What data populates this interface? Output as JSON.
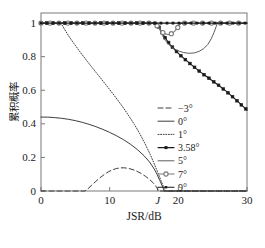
{
  "chart_data": {
    "type": "line",
    "title": "",
    "xlabel": "JSR/dB",
    "ylabel": "累积概率",
    "xlim": [
      0,
      30
    ],
    "ylim": [
      0,
      1.06
    ],
    "grid": false,
    "legend_position": "right-middle",
    "x_tick_labels": [
      "0",
      "10",
      "J",
      "20",
      "30"
    ],
    "x_tick_values": [
      0,
      10,
      17,
      20,
      30
    ],
    "x_tick_italic_index": 2,
    "y_tick_labels": [
      "0",
      "0.2",
      "0.4",
      "0.6",
      "0.8",
      "1"
    ],
    "y_tick_values": [
      0,
      0.2,
      0.4,
      0.6,
      0.8,
      1
    ],
    "jammer_threshold": 17,
    "series": [
      {
        "name": "-3°",
        "label": "−3°",
        "style": "dashed",
        "color": "#333333",
        "marker": "none",
        "points": [
          [
            0,
            0.0
          ],
          [
            2,
            0.0
          ],
          [
            4,
            0.0
          ],
          [
            6,
            0.0
          ],
          [
            6.4,
            0.0
          ],
          [
            6.8,
            0.012
          ],
          [
            7.4,
            0.035
          ],
          [
            8.0,
            0.058
          ],
          [
            8.6,
            0.079
          ],
          [
            9.2,
            0.098
          ],
          [
            9.8,
            0.114
          ],
          [
            10.4,
            0.126
          ],
          [
            11.0,
            0.134
          ],
          [
            11.6,
            0.138
          ],
          [
            12.2,
            0.138
          ],
          [
            12.8,
            0.134
          ],
          [
            13.4,
            0.127
          ],
          [
            14.0,
            0.117
          ],
          [
            14.6,
            0.104
          ],
          [
            15.2,
            0.088
          ],
          [
            15.8,
            0.069
          ],
          [
            16.3,
            0.05
          ],
          [
            16.7,
            0.031
          ],
          [
            16.95,
            0.014
          ],
          [
            17.1,
            0.0
          ],
          [
            20,
            0.0
          ],
          [
            25,
            0.0
          ],
          [
            30,
            0.0
          ]
        ]
      },
      {
        "name": "0°",
        "label": "0°",
        "style": "solid",
        "color": "#333333",
        "marker": "none",
        "points": [
          [
            0,
            0.44
          ],
          [
            1,
            0.44
          ],
          [
            2,
            0.437
          ],
          [
            3,
            0.433
          ],
          [
            4,
            0.427
          ],
          [
            5,
            0.419
          ],
          [
            6,
            0.409
          ],
          [
            7,
            0.397
          ],
          [
            8,
            0.383
          ],
          [
            9,
            0.367
          ],
          [
            10,
            0.349
          ],
          [
            11,
            0.329
          ],
          [
            12,
            0.306
          ],
          [
            13,
            0.279
          ],
          [
            14,
            0.248
          ],
          [
            15,
            0.21
          ],
          [
            15.8,
            0.173
          ],
          [
            16.4,
            0.137
          ],
          [
            16.9,
            0.099
          ],
          [
            17.3,
            0.063
          ],
          [
            17.6,
            0.035
          ],
          [
            17.8,
            0.016
          ],
          [
            17.95,
            0.0
          ],
          [
            20,
            0.0
          ],
          [
            25,
            0.0
          ],
          [
            30,
            0.0
          ]
        ]
      },
      {
        "name": "1°",
        "label": "1°",
        "style": "dotted",
        "color": "#333333",
        "marker": "none",
        "points": [
          [
            2.9,
            1.0
          ],
          [
            3.4,
            0.965
          ],
          [
            4.0,
            0.925
          ],
          [
            4.8,
            0.878
          ],
          [
            5.6,
            0.833
          ],
          [
            6.4,
            0.79
          ],
          [
            7.2,
            0.748
          ],
          [
            8.0,
            0.707
          ],
          [
            8.8,
            0.666
          ],
          [
            9.6,
            0.625
          ],
          [
            10.4,
            0.583
          ],
          [
            11.2,
            0.54
          ],
          [
            12.0,
            0.495
          ],
          [
            12.8,
            0.447
          ],
          [
            13.6,
            0.396
          ],
          [
            14.4,
            0.34
          ],
          [
            15.2,
            0.278
          ],
          [
            15.9,
            0.218
          ],
          [
            16.5,
            0.161
          ],
          [
            17.0,
            0.111
          ],
          [
            17.4,
            0.07
          ],
          [
            17.7,
            0.04
          ],
          [
            17.9,
            0.018
          ],
          [
            18.05,
            0.0
          ],
          [
            20,
            0.0
          ],
          [
            25,
            0.0
          ],
          [
            30,
            0.0
          ]
        ]
      },
      {
        "name": "3.58°",
        "label": "3.58°",
        "style": "solid",
        "color": "#1a1a1a",
        "marker": "square-filled",
        "points": [
          [
            0,
            1.0
          ],
          [
            2,
            1.0
          ],
          [
            4,
            1.0
          ],
          [
            6,
            1.0
          ],
          [
            8,
            1.0
          ],
          [
            10,
            1.0
          ],
          [
            12,
            1.0
          ],
          [
            14,
            1.0
          ],
          [
            15.5,
            1.0
          ],
          [
            16.2,
            1.0
          ],
          [
            16.7,
            0.998
          ],
          [
            17.0,
            0.99
          ],
          [
            17.3,
            0.968
          ],
          [
            17.7,
            0.938
          ],
          [
            18.2,
            0.905
          ],
          [
            18.8,
            0.872
          ],
          [
            19.5,
            0.84
          ],
          [
            20.3,
            0.808
          ],
          [
            21.2,
            0.776
          ],
          [
            22.1,
            0.745
          ],
          [
            23.0,
            0.715
          ],
          [
            24.0,
            0.685
          ],
          [
            25.0,
            0.655
          ],
          [
            26.0,
            0.625
          ],
          [
            27.0,
            0.593
          ],
          [
            28.0,
            0.558
          ],
          [
            29.0,
            0.52
          ],
          [
            30.0,
            0.482
          ]
        ]
      },
      {
        "name": "5°",
        "label": "5°",
        "style": "solid",
        "color": "#555555",
        "marker": "none",
        "points": [
          [
            0,
            1.0
          ],
          [
            4,
            1.0
          ],
          [
            8,
            1.0
          ],
          [
            12,
            1.0
          ],
          [
            15.5,
            1.0
          ],
          [
            16.3,
            1.0
          ],
          [
            16.8,
            0.996
          ],
          [
            17.1,
            0.982
          ],
          [
            17.4,
            0.955
          ],
          [
            17.7,
            0.925
          ],
          [
            18.1,
            0.897
          ],
          [
            18.6,
            0.872
          ],
          [
            19.2,
            0.852
          ],
          [
            19.9,
            0.836
          ],
          [
            20.7,
            0.825
          ],
          [
            21.5,
            0.82
          ],
          [
            22.3,
            0.822
          ],
          [
            23.0,
            0.831
          ],
          [
            23.7,
            0.848
          ],
          [
            24.3,
            0.873
          ],
          [
            24.8,
            0.907
          ],
          [
            25.2,
            0.945
          ],
          [
            25.5,
            0.978
          ],
          [
            25.7,
            1.0
          ],
          [
            27,
            1.0
          ],
          [
            30,
            1.0
          ]
        ]
      },
      {
        "name": "7°",
        "label": "7°",
        "style": "solid",
        "color": "#7a7a7a",
        "marker": "circle",
        "points": [
          [
            0,
            1.0
          ],
          [
            5,
            1.0
          ],
          [
            10,
            1.0
          ],
          [
            14,
            1.0
          ],
          [
            15.8,
            1.0
          ],
          [
            16.4,
            0.999
          ],
          [
            16.8,
            0.99
          ],
          [
            17.1,
            0.972
          ],
          [
            17.4,
            0.955
          ],
          [
            17.8,
            0.942
          ],
          [
            18.2,
            0.934
          ],
          [
            18.6,
            0.932
          ],
          [
            19.0,
            0.937
          ],
          [
            19.4,
            0.949
          ],
          [
            19.8,
            0.967
          ],
          [
            20.1,
            0.984
          ],
          [
            20.4,
            1.0
          ],
          [
            23,
            1.0
          ],
          [
            27,
            1.0
          ],
          [
            30,
            1.0
          ]
        ]
      },
      {
        "name": "9°",
        "label": "9°",
        "style": "solid",
        "color": "#1a1a1a",
        "marker": "square-small",
        "points": [
          [
            0,
            1.0
          ],
          [
            3,
            1.0
          ],
          [
            6,
            1.0
          ],
          [
            9,
            1.0
          ],
          [
            12,
            1.0
          ],
          [
            15,
            1.0
          ],
          [
            16.5,
            1.0
          ],
          [
            17.2,
            1.0
          ],
          [
            18,
            1.0
          ],
          [
            20,
            1.0
          ],
          [
            23,
            1.0
          ],
          [
            26,
            1.0
          ],
          [
            30,
            1.0
          ]
        ]
      }
    ]
  },
  "legend": {
    "entries": [
      {
        "label": "−3°",
        "style": "dashed",
        "marker": "none",
        "color": "#333333"
      },
      {
        "label": "0°",
        "style": "solid",
        "marker": "none",
        "color": "#333333"
      },
      {
        "label": "1°",
        "style": "dotted",
        "marker": "none",
        "color": "#333333"
      },
      {
        "label": "3.58°",
        "style": "solid",
        "marker": "square-filled",
        "color": "#1a1a1a"
      },
      {
        "label": "5°",
        "style": "solid",
        "marker": "none",
        "color": "#555555"
      },
      {
        "label": "7°",
        "style": "solid",
        "marker": "circle",
        "color": "#7a7a7a"
      },
      {
        "label": "9°",
        "style": "solid",
        "marker": "square-small",
        "color": "#1a1a1a"
      }
    ]
  }
}
